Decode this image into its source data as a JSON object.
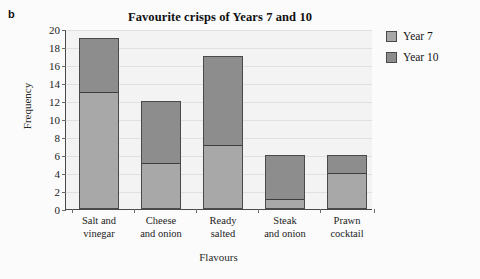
{
  "part_label": "b",
  "chart_data": {
    "type": "bar",
    "subtype": "stacked-bar",
    "title": "Favourite crisps of Years 7 and 10",
    "xlabel": "Flavours",
    "ylabel": "Frequency",
    "ylim": [
      0,
      20
    ],
    "ytick_step": 2,
    "yticks": [
      0,
      2,
      4,
      6,
      8,
      10,
      12,
      14,
      16,
      18,
      20
    ],
    "ytick_labels": [
      "0",
      "2",
      "4",
      "6",
      "8",
      "10",
      "12",
      "14",
      "16",
      "18",
      "20"
    ],
    "grid": true,
    "grid_axis": "y",
    "legend_position": "right",
    "categories": [
      "Salt and vinegar",
      "Cheese and onion",
      "Ready salted",
      "Steak and onion",
      "Prawn cocktail"
    ],
    "category_lines": [
      [
        "Salt and",
        "vinegar"
      ],
      [
        "Cheese",
        "and onion"
      ],
      [
        "Ready",
        "salted"
      ],
      [
        "Steak",
        "and onion"
      ],
      [
        "Prawn",
        "cocktail"
      ]
    ],
    "series": [
      {
        "name": "Year 7",
        "color": "#a8a8a8",
        "values": [
          13,
          5,
          7,
          1,
          4
        ]
      },
      {
        "name": "Year 10",
        "color": "#8d8d8d",
        "values": [
          6,
          7,
          10,
          5,
          2
        ]
      }
    ],
    "totals": [
      19,
      12,
      17,
      6,
      6
    ]
  },
  "legend": {
    "items": [
      {
        "label": "Year 7",
        "color": "#a8a8a8"
      },
      {
        "label": "Year 10",
        "color": "#8d8d8d"
      }
    ]
  }
}
